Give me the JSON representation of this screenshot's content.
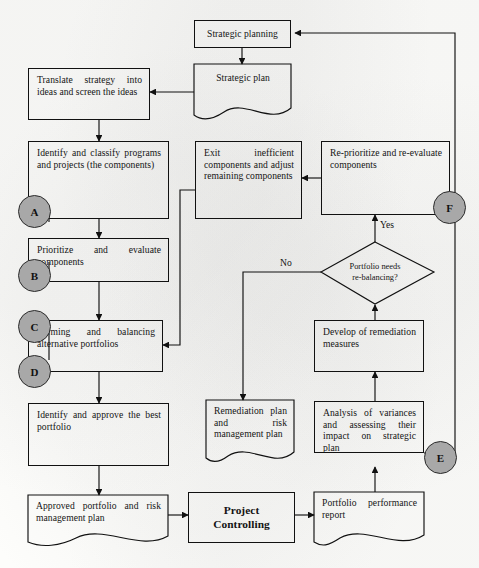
{
  "diagram": {
    "colors": {
      "line": "#111111",
      "connector_fill": "#a8a8a8",
      "text": "#141414",
      "background": "#fdfdfb"
    },
    "nodes": [
      {
        "id": "strategic-planning",
        "label": "Strategic planning",
        "shape": "process"
      },
      {
        "id": "strategic-plan",
        "label": "Strategic plan",
        "shape": "document"
      },
      {
        "id": "translate-strategy",
        "label": "Translate strategy into ideas and screen the ideas",
        "shape": "process"
      },
      {
        "id": "identify-classify",
        "label": "Identify and classify programs and projects (the components)",
        "shape": "process"
      },
      {
        "id": "prioritize-evaluate",
        "label": "Prioritize and evaluate components",
        "shape": "process"
      },
      {
        "id": "forming-balancing",
        "label": "Forming and balancing alternative portfolios",
        "shape": "process"
      },
      {
        "id": "identify-approve",
        "label": "Identify and approve the best portfolio",
        "shape": "process"
      },
      {
        "id": "approved-portfolio",
        "label": "Approved portfolio and risk management plan",
        "shape": "document"
      },
      {
        "id": "exit-inefficient",
        "label": "Exit inefficient components and adjust remaining components",
        "shape": "process"
      },
      {
        "id": "reprioritize",
        "label": "Re-prioritize and re-evaluate components",
        "shape": "process"
      },
      {
        "id": "remediation-plan",
        "label": "Remediation plan and risk management plan",
        "shape": "document"
      },
      {
        "id": "project-controlling",
        "label": "Project Controlling",
        "shape": "process",
        "bold": true
      },
      {
        "id": "develop-remediation",
        "label": "Develop of remediation measures",
        "shape": "process"
      },
      {
        "id": "analysis-variances",
        "label": "Analysis of variances and assessing their impact on strategic plan",
        "shape": "process"
      },
      {
        "id": "portfolio-report",
        "label": "Portfolio performance report",
        "shape": "document"
      },
      {
        "id": "decision-rebalancing",
        "label": "Portfolio needs re-balancing?",
        "shape": "decision",
        "line1": "Portfolio needs",
        "line2": "re-balancing?"
      }
    ],
    "connectors": [
      {
        "id": "connector-a",
        "label": "A"
      },
      {
        "id": "connector-b",
        "label": "B"
      },
      {
        "id": "connector-c",
        "label": "C"
      },
      {
        "id": "connector-d",
        "label": "D"
      },
      {
        "id": "connector-e",
        "label": "E"
      },
      {
        "id": "connector-f",
        "label": "F"
      }
    ],
    "edge_labels": [
      {
        "id": "edge-label-yes",
        "label": "Yes"
      },
      {
        "id": "edge-label-no",
        "label": "No"
      }
    ]
  }
}
